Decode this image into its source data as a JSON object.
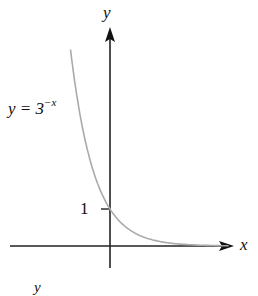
{
  "chart_data": {
    "type": "line",
    "title": "",
    "xlabel": "x",
    "ylabel": "y",
    "series": [
      {
        "name": "y = 3^-x",
        "function": "3^(-x)",
        "x": [
          -1.5,
          -1.25,
          -1,
          -0.75,
          -0.5,
          -0.25,
          0,
          0.25,
          0.5,
          0.75,
          1,
          1.5,
          2,
          2.5,
          3,
          3.5,
          4,
          4.5
        ],
        "values": [
          5.2,
          3.95,
          3,
          2.28,
          1.73,
          1.32,
          1,
          0.76,
          0.58,
          0.44,
          0.33,
          0.19,
          0.11,
          0.06,
          0.04,
          0.02,
          0.01,
          0.01
        ],
        "color": "#aaaaaa"
      }
    ],
    "yticks": [
      1
    ],
    "ytick_labels": [
      "1"
    ],
    "annotations": [
      "y = 3^-x"
    ],
    "grid": false,
    "legend": "none"
  },
  "labels": {
    "y_axis": "y",
    "x_axis": "x",
    "tick_one": "1",
    "curve_lhs": "y = 3",
    "curve_exp": "−x",
    "stray_y": "y"
  }
}
